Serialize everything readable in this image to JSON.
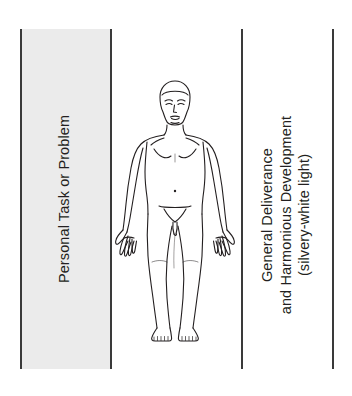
{
  "diagram": {
    "orientation": "rotated-90-ccw",
    "background_color": "#ffffff",
    "rule_color": "#3a3a3a",
    "band_color": "#ebebeb",
    "text_color": "#231f20"
  },
  "left_column": {
    "label": "Personal Task or Problem",
    "shaded": true
  },
  "right_column": {
    "lines": [
      "General Deliverance",
      "and Harmonious Development",
      "(silvery-white light)"
    ],
    "line1": "General Deliverance",
    "line2": "and Harmonious Development",
    "line3": "(silvery-white light)",
    "shaded": false
  },
  "center_figure": {
    "name": "human-body-outline",
    "description": "front-facing nude human figure line drawing, arms slightly away from body, palms forward",
    "stroke_color": "#231f20"
  }
}
